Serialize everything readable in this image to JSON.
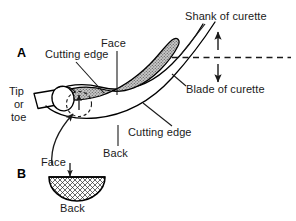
{
  "figure": {
    "panels": [
      {
        "id": "A",
        "letter": "A",
        "description": "Side view of curette blade, shank and tip"
      },
      {
        "id": "B",
        "letter": "B",
        "description": "Cross-section of curette blade"
      }
    ],
    "labels": {
      "shank_of_curette": "Shank of curette",
      "blade_of_curette": "Blade of curette",
      "face_top": "Face",
      "cutting_edge_upper": "Cutting edge",
      "cutting_edge_lower": "Cutting edge",
      "back_middle": "Back",
      "tip_line1": "Tip",
      "tip_line2": "or",
      "tip_line3": "toe",
      "face_cross_section": "Face",
      "back_cross_section": "Back"
    },
    "colors": {
      "ink": "#1a1a1a",
      "outline": "#000000",
      "blade_fill": "#b9b9b9",
      "background": "#ffffff",
      "crosshatch": "#2a2a2a"
    }
  }
}
